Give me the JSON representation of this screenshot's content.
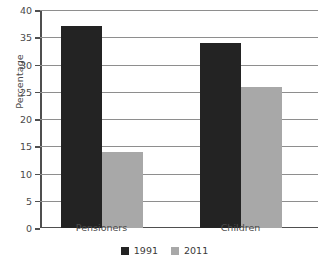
{
  "chart_data": {
    "type": "bar",
    "title": "",
    "subtitle": "",
    "xlabel": "",
    "ylabel": "Percentage",
    "categories": [
      "Pensioners",
      "Children"
    ],
    "series": [
      {
        "name": "1991",
        "color": "#232323",
        "values": [
          37,
          34
        ]
      },
      {
        "name": "2011",
        "color": "#a8a8a8",
        "values": [
          14,
          25.8
        ]
      }
    ],
    "ylim": [
      0,
      40
    ],
    "ytick_labels": [
      "0",
      "5",
      "10",
      "15",
      "20",
      "25",
      "30",
      "35",
      "40"
    ],
    "ytick_values": [
      0,
      5,
      10,
      15,
      20,
      25,
      30,
      35,
      40
    ],
    "grid": "horizontal",
    "legend_position": "bottom-center",
    "annotations": []
  },
  "axis": {
    "y_title": "Percentage"
  },
  "legend": {
    "items": [
      {
        "label": "1991",
        "color": "#232323"
      },
      {
        "label": "2011",
        "color": "#a8a8a8"
      }
    ]
  }
}
